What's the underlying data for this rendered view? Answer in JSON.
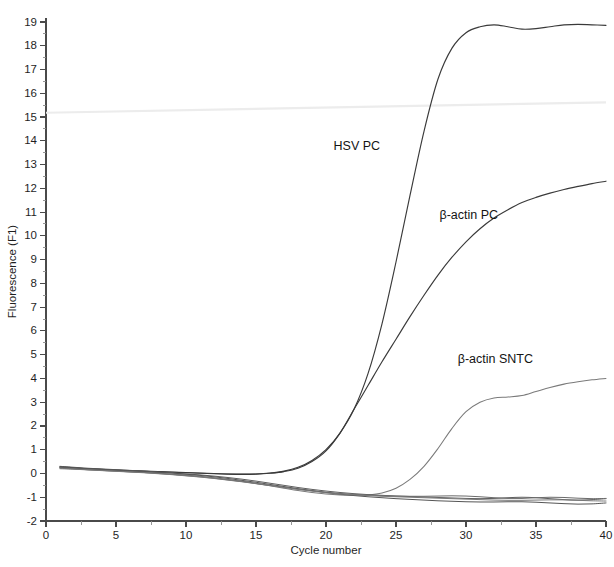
{
  "chart_data": {
    "type": "line",
    "title": "",
    "xlabel": "Cycle number",
    "ylabel": "Fluorescence (F1)",
    "xlim": [
      0,
      40
    ],
    "ylim": [
      -2,
      19
    ],
    "x_major_ticks": [
      0,
      5,
      10,
      15,
      20,
      25,
      30,
      35,
      40
    ],
    "x_minor_step": 2.5,
    "y_major_ticks": [
      -2,
      -1,
      0,
      1,
      2,
      3,
      4,
      5,
      6,
      7,
      8,
      9,
      10,
      11,
      12,
      13,
      14,
      15,
      16,
      17,
      18,
      19
    ],
    "y_minor_step": 0.5,
    "grid": false,
    "legend_position": "inline-annotations",
    "x": [
      1,
      2,
      3,
      4,
      5,
      6,
      7,
      8,
      9,
      10,
      11,
      12,
      13,
      14,
      15,
      16,
      17,
      18,
      19,
      20,
      21,
      22,
      23,
      24,
      25,
      26,
      27,
      28,
      29,
      30,
      31,
      32,
      33,
      34,
      35,
      36,
      37,
      38,
      39,
      40
    ],
    "series": [
      {
        "name": "HSV PC",
        "color": "#3a3a3a",
        "width": 1.15,
        "values": [
          0.28,
          0.24,
          0.2,
          0.17,
          0.14,
          0.12,
          0.1,
          0.08,
          0.06,
          0.04,
          0.02,
          0.0,
          -0.02,
          -0.03,
          -0.02,
          0.02,
          0.1,
          0.26,
          0.55,
          1.0,
          1.7,
          2.7,
          4.2,
          6.3,
          8.9,
          11.7,
          14.4,
          16.6,
          17.9,
          18.55,
          18.8,
          18.88,
          18.8,
          18.7,
          18.72,
          18.8,
          18.88,
          18.9,
          18.88,
          18.86
        ]
      },
      {
        "name": "β-actin PC",
        "color": "#3a3a3a",
        "width": 1.15,
        "values": [
          0.26,
          0.22,
          0.19,
          0.16,
          0.13,
          0.11,
          0.09,
          0.07,
          0.05,
          0.03,
          0.01,
          -0.01,
          -0.03,
          -0.04,
          -0.03,
          0.01,
          0.08,
          0.22,
          0.5,
          0.95,
          1.7,
          2.7,
          3.7,
          4.7,
          5.65,
          6.6,
          7.5,
          8.35,
          9.1,
          9.75,
          10.3,
          10.75,
          11.1,
          11.4,
          11.62,
          11.8,
          11.95,
          12.08,
          12.2,
          12.3
        ]
      },
      {
        "name": "β-actin SNTC",
        "color": "#7a7a7a",
        "width": 1.05,
        "values": [
          0.24,
          0.2,
          0.16,
          0.13,
          0.1,
          0.07,
          0.04,
          0.01,
          -0.03,
          -0.07,
          -0.12,
          -0.18,
          -0.25,
          -0.33,
          -0.42,
          -0.52,
          -0.62,
          -0.72,
          -0.8,
          -0.86,
          -0.9,
          -0.92,
          -0.9,
          -0.82,
          -0.62,
          -0.25,
          0.3,
          1.05,
          1.9,
          2.6,
          3.0,
          3.18,
          3.22,
          3.28,
          3.45,
          3.62,
          3.76,
          3.86,
          3.94,
          4.0
        ]
      },
      {
        "name": "baseline-1",
        "color": "#5e5e5e",
        "width": 1.0,
        "values": [
          0.27,
          0.23,
          0.2,
          0.17,
          0.14,
          0.11,
          0.08,
          0.05,
          0.02,
          -0.02,
          -0.06,
          -0.11,
          -0.17,
          -0.24,
          -0.32,
          -0.41,
          -0.5,
          -0.59,
          -0.67,
          -0.74,
          -0.8,
          -0.85,
          -0.89,
          -0.92,
          -0.95,
          -0.97,
          -0.99,
          -1.01,
          -1.03,
          -1.05,
          -1.06,
          -1.05,
          -1.02,
          -1.0,
          -1.02,
          -1.06,
          -1.1,
          -1.12,
          -1.1,
          -1.06
        ]
      },
      {
        "name": "baseline-2",
        "color": "#6b6b6b",
        "width": 1.0,
        "values": [
          0.22,
          0.19,
          0.16,
          0.13,
          0.1,
          0.07,
          0.04,
          0.0,
          -0.04,
          -0.09,
          -0.14,
          -0.2,
          -0.27,
          -0.34,
          -0.42,
          -0.5,
          -0.58,
          -0.66,
          -0.73,
          -0.79,
          -0.84,
          -0.88,
          -0.91,
          -0.93,
          -0.95,
          -0.96,
          -0.96,
          -0.95,
          -0.94,
          -0.95,
          -0.98,
          -1.02,
          -1.05,
          -1.05,
          -1.02,
          -1.0,
          -1.01,
          -1.04,
          -1.06,
          -1.05
        ]
      },
      {
        "name": "baseline-3",
        "color": "#555555",
        "width": 1.0,
        "values": [
          0.3,
          0.26,
          0.22,
          0.19,
          0.16,
          0.13,
          0.1,
          0.06,
          0.02,
          -0.03,
          -0.08,
          -0.14,
          -0.21,
          -0.29,
          -0.37,
          -0.46,
          -0.55,
          -0.64,
          -0.72,
          -0.8,
          -0.87,
          -0.93,
          -0.98,
          -1.02,
          -1.06,
          -1.09,
          -1.12,
          -1.15,
          -1.17,
          -1.19,
          -1.2,
          -1.2,
          -1.19,
          -1.19,
          -1.21,
          -1.24,
          -1.27,
          -1.29,
          -1.28,
          -1.24
        ]
      },
      {
        "name": "baseline-4",
        "color": "#787878",
        "width": 1.0,
        "values": [
          0.2,
          0.18,
          0.15,
          0.12,
          0.09,
          0.06,
          0.03,
          -0.01,
          -0.05,
          -0.1,
          -0.15,
          -0.21,
          -0.28,
          -0.35,
          -0.43,
          -0.51,
          -0.59,
          -0.67,
          -0.74,
          -0.81,
          -0.86,
          -0.9,
          -0.93,
          -0.96,
          -0.98,
          -1.0,
          -1.02,
          -1.04,
          -1.06,
          -1.08,
          -1.1,
          -1.12,
          -1.13,
          -1.13,
          -1.12,
          -1.11,
          -1.11,
          -1.13,
          -1.15,
          -1.16
        ]
      }
    ],
    "annotations": [
      {
        "text": "HSV PC",
        "x": 22.2,
        "y": 13.6
      },
      {
        "text": "β-actin PC",
        "x": 30.2,
        "y": 10.7
      },
      {
        "text": "β-actin SNTC",
        "x": 32.1,
        "y": 4.65
      }
    ]
  }
}
